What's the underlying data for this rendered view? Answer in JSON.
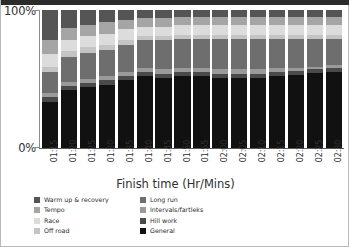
{
  "chart_data": {
    "type": "bar",
    "stacked": true,
    "normalized": "100%",
    "title": "",
    "xlabel": "Finish time (Hr/Mins)",
    "ylabel": "",
    "ylim": [
      0,
      100
    ],
    "ytick_labels": [
      "100%",
      "0%"
    ],
    "ytick_values": [
      100,
      0
    ],
    "grid": false,
    "legend_position": "bottom-left",
    "categories": [
      "01:15",
      "01:20",
      "01:25",
      "01:30",
      "01:35",
      "01:40",
      "01:45",
      "01:50",
      "01:55",
      "02:00",
      "02:05",
      "02:10",
      "02:15",
      "02:20",
      "02:25",
      "02:30"
    ],
    "series": [
      {
        "name": "General",
        "color": "#111111",
        "values": [
          33,
          42,
          44,
          46,
          49,
          52,
          51,
          52,
          52,
          51,
          51,
          51,
          52,
          53,
          54,
          55
        ]
      },
      {
        "name": "Hill work",
        "color": "#4a4a4a",
        "values": [
          4,
          3,
          3,
          3,
          3,
          3,
          3,
          3,
          3,
          3,
          3,
          3,
          3,
          3,
          3,
          3
        ]
      },
      {
        "name": "Intervals/fartleks",
        "color": "#9a9a9a",
        "values": [
          3,
          3,
          3,
          3,
          3,
          3,
          3,
          3,
          3,
          3,
          3,
          3,
          3,
          2,
          2,
          2
        ]
      },
      {
        "name": "Long run",
        "color": "#6e6e6e",
        "values": [
          15,
          18,
          19,
          19,
          20,
          20,
          21,
          21,
          21,
          22,
          22,
          22,
          21,
          21,
          20,
          19
        ]
      },
      {
        "name": "Off road",
        "color": "#c4c4c4",
        "values": [
          4,
          4,
          4,
          4,
          3,
          3,
          3,
          3,
          3,
          3,
          3,
          3,
          3,
          3,
          3,
          3
        ]
      },
      {
        "name": "Race",
        "color": "#dcdcdc",
        "values": [
          9,
          8,
          8,
          8,
          8,
          7,
          7,
          7,
          7,
          7,
          7,
          7,
          7,
          7,
          7,
          7
        ]
      },
      {
        "name": "Tempo",
        "color": "#a5a5a5",
        "values": [
          10,
          9,
          8,
          8,
          7,
          6,
          6,
          6,
          6,
          6,
          6,
          6,
          6,
          6,
          6,
          6
        ]
      },
      {
        "name": "Warm up & recovery",
        "color": "#555555",
        "values": [
          22,
          13,
          11,
          9,
          7,
          6,
          6,
          5,
          5,
          5,
          5,
          5,
          5,
          5,
          5,
          5
        ]
      }
    ]
  },
  "axes": {
    "y_top_label": "100%",
    "y_bottom_label": "0%",
    "x_axis_title": "Finish time (Hr/Mins)"
  },
  "legend": {
    "column_left": [
      {
        "label": "Warm up & recovery",
        "color": "#555555"
      },
      {
        "label": "Tempo",
        "color": "#a5a5a5"
      },
      {
        "label": "Race",
        "color": "#dcdcdc"
      },
      {
        "label": "Off road",
        "color": "#c4c4c4"
      }
    ],
    "column_right": [
      {
        "label": "Long run",
        "color": "#6e6e6e"
      },
      {
        "label": "Intervals/fartleks",
        "color": "#9a9a9a"
      },
      {
        "label": "Hill work",
        "color": "#4a4a4a"
      },
      {
        "label": "General",
        "color": "#111111"
      }
    ]
  }
}
